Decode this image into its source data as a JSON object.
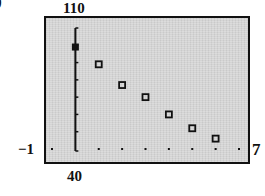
{
  "figure_label": "b",
  "window": {
    "xmin_label": "−1",
    "xmax_label": "7",
    "ymin_label": "40",
    "ymax_label": "110"
  },
  "chart_data": {
    "type": "scatter",
    "title": "",
    "xlabel": "",
    "ylabel": "",
    "xlim": [
      -1,
      7
    ],
    "ylim": [
      40,
      110
    ],
    "x_tick_step": 1,
    "y_tick_step": 10,
    "grid": false,
    "legend": null,
    "marker": "hollow-square",
    "x": [
      0,
      1,
      2,
      3,
      4,
      5,
      6
    ],
    "y": [
      99,
      89,
      77,
      70,
      60,
      52,
      46
    ],
    "highlighted_point_index": 0,
    "annotations": [
      "Graphing calculator viewing window: Xmin=-1, Xmax=7, Ymin=40, Ymax=110"
    ]
  },
  "colors": {
    "screen_bg": "#d4d4d4",
    "ink": "#111111"
  }
}
